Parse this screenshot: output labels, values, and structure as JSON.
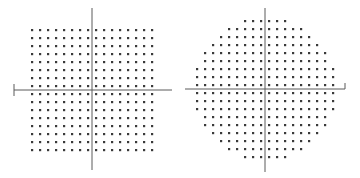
{
  "colors": {
    "background": "#ffffff",
    "dot": "#3a3a3a",
    "axis": "#5a5a5a"
  },
  "diagrams": [
    {
      "name": "square-grid",
      "shape": "square",
      "axis_origin": [
        92,
        90
      ],
      "h_axis": {
        "x1": 14,
        "x2": 172,
        "end_tick": {
          "x": 14,
          "y1": 84,
          "y2": 96
        }
      },
      "v_axis": {
        "y1": 8,
        "y2": 170
      },
      "spacing": 8,
      "rows_above": 8,
      "rows_below": 8,
      "cols_left": 8,
      "cols_right": 8
    },
    {
      "name": "circular-grid",
      "shape": "circle",
      "axis_origin": [
        265,
        89
      ],
      "h_axis": {
        "x1": 185,
        "x2": 345,
        "end_tick": {
          "x": 345,
          "y1": 83,
          "y2": 89
        }
      },
      "v_axis": {
        "y1": 8,
        "y2": 172
      },
      "spacing": 8,
      "row_half_widths": [
        3,
        5,
        6,
        7,
        8,
        8,
        9,
        9,
        9,
        9,
        9,
        9,
        8,
        8,
        7,
        6,
        5,
        3
      ]
    }
  ]
}
